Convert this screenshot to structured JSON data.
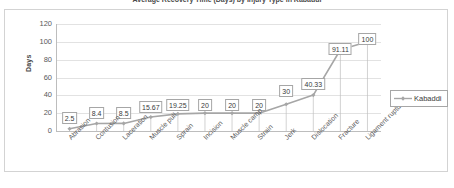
{
  "chart_data": {
    "type": "line",
    "title": "Average Recovery Time (Days) by Injury Type in Kabaddi",
    "xlabel": "",
    "ylabel": "Days",
    "ylim": [
      0,
      120
    ],
    "ytick_step": 20,
    "yticks": [
      "120",
      "100",
      "80",
      "60",
      "40",
      "20",
      "0"
    ],
    "grid": true,
    "legend_position": "right",
    "categories": [
      "Abrasion",
      "Contusion",
      "Laceration",
      "Muscle pull",
      "Sprain",
      "Incision",
      "Muscle camp",
      "Strain",
      "Jerk",
      "Dislocation",
      "Fracture",
      "Ligament rupture"
    ],
    "series": [
      {
        "name": "Kabaddi",
        "color": "#a6a6a6",
        "marker": "diamond",
        "values": [
          2.5,
          8.4,
          8.5,
          15.67,
          19.25,
          20,
          20,
          20,
          30,
          40.33,
          91.11,
          100
        ],
        "value_labels": [
          "2.5",
          "8.4",
          "8.5",
          "15.67",
          "19.25",
          "20",
          "20",
          "20",
          "30",
          "40.33",
          "91.11",
          "100"
        ]
      }
    ]
  },
  "legend": {
    "entries": [
      {
        "label": "Kabaddi"
      }
    ]
  },
  "colors": {
    "series": "#a6a6a6",
    "gridline": "#e2e2e2",
    "axis": "#bdbdbd",
    "frame": "#d3d3d3",
    "label_border": "#a6a6a6",
    "text": "#3a3a3a"
  }
}
